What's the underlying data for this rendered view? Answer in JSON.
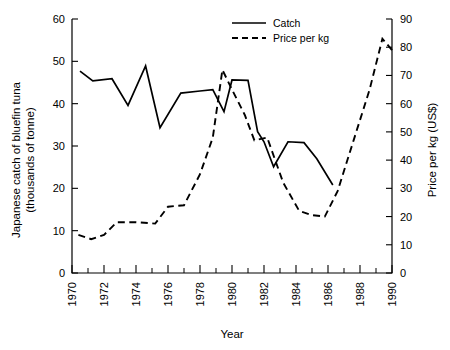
{
  "chart_data": {
    "type": "line",
    "title": "",
    "xlabel": "Year",
    "ylabel": "Japanese catch of bluefin tuna (thousands of tonne)",
    "y2label": "Price per kg (US$)",
    "xlim": [
      1970,
      1990
    ],
    "ylim": [
      0,
      60
    ],
    "y2lim": [
      0,
      90
    ],
    "grid": false,
    "legend_position": "top-center",
    "x_ticks": [
      1970,
      1972,
      1974,
      1976,
      1978,
      1980,
      1982,
      1984,
      1986,
      1988,
      1990
    ],
    "x_minor_ticks": [
      1971,
      1973,
      1975,
      1977,
      1979,
      1981,
      1983,
      1985,
      1987,
      1989
    ],
    "y_ticks": [
      0,
      10,
      20,
      30,
      40,
      50,
      60
    ],
    "y2_ticks": [
      0,
      10,
      20,
      30,
      40,
      50,
      60,
      70,
      80,
      90
    ],
    "series": [
      {
        "name": "Catch",
        "axis": "left",
        "style": "solid",
        "units": "thousands of tonne",
        "x": [
          1970.5,
          1971.3,
          1972.5,
          1973.5,
          1974.6,
          1975.5,
          1976.8,
          1978.0,
          1978.8,
          1979.5,
          1980.0,
          1981.0,
          1981.6,
          1982.0,
          1982.6,
          1983.5,
          1984.5,
          1985.3,
          1986.3
        ],
        "values": [
          47.7,
          45.4,
          45.9,
          39.6,
          48.9,
          34.3,
          42.5,
          43.0,
          43.3,
          38.1,
          45.6,
          45.5,
          33.4,
          31.0,
          25.1,
          31.0,
          30.8,
          27.0,
          20.8
        ]
      },
      {
        "name": "Price per kg",
        "axis": "right",
        "style": "dashed",
        "units": "US$",
        "x": [
          1970.4,
          1971.2,
          1972.0,
          1972.8,
          1974.0,
          1975.2,
          1976.0,
          1977.0,
          1978.0,
          1978.8,
          1979.4,
          1980.0,
          1980.8,
          1981.4,
          1982.2,
          1983.2,
          1984.2,
          1985.0,
          1985.8,
          1986.6,
          1987.6,
          1988.6,
          1989.4,
          1990.0
        ],
        "values": [
          13.5,
          12.0,
          13.5,
          18.0,
          18.0,
          17.5,
          23.5,
          24.0,
          35.0,
          48.0,
          72.0,
          65.0,
          56.0,
          47.0,
          48.0,
          32.0,
          22.0,
          20.5,
          20.0,
          29.0,
          47.0,
          65.0,
          83.0,
          79.0
        ]
      }
    ]
  },
  "legend": {
    "items": [
      {
        "label": "Catch",
        "style": "solid"
      },
      {
        "label": "Price per kg",
        "style": "dashed"
      }
    ]
  },
  "axes": {
    "left_title_line1": "Japanese catch of bluefin tuna",
    "left_title_line2": "(thousands of tonne)",
    "right_title": "Price per kg (US$)",
    "bottom_title": "Year"
  }
}
